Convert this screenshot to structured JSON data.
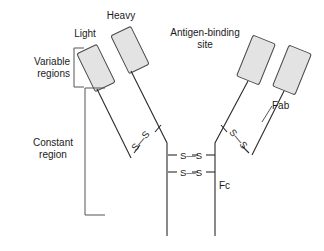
{
  "figure": {
    "background_color": "#ffffff",
    "domain_box_fill": "#e3e3e3",
    "domain_box_stroke": "#4a4a4a",
    "line_color": "#2b2b2b",
    "bracket_color": "#555555",
    "text_color": "#1a1a1a",
    "width": 324,
    "height": 251
  },
  "labels": {
    "light_chain": "Light",
    "heavy_chain": "Heavy",
    "variable_regions": "Variable\nregions",
    "constant_region": "Constant\nregion",
    "antigen_binding_site": "Antigen-binding\nsite",
    "fab": "Fab",
    "fc": "Fc"
  },
  "disulfide_bonds": {
    "inter_heavy_upper": "S—S",
    "inter_heavy_lower": "S—S",
    "light_heavy_left": "S—S",
    "light_heavy_right": "S—S",
    "sulfur_symbol": "S"
  },
  "structure": {
    "variable_domain_count": 4,
    "variable_domains": [
      {
        "name": "light-chain-variable-left",
        "tilt_deg": -28
      },
      {
        "name": "heavy-chain-variable-left",
        "tilt_deg": -28
      },
      {
        "name": "heavy-chain-variable-right",
        "tilt_deg": 22
      },
      {
        "name": "light-chain-variable-right",
        "tilt_deg": 22
      }
    ],
    "chains": [
      "light-left",
      "heavy-left",
      "heavy-right",
      "light-right"
    ],
    "hinge_disulfide_count": 2
  }
}
